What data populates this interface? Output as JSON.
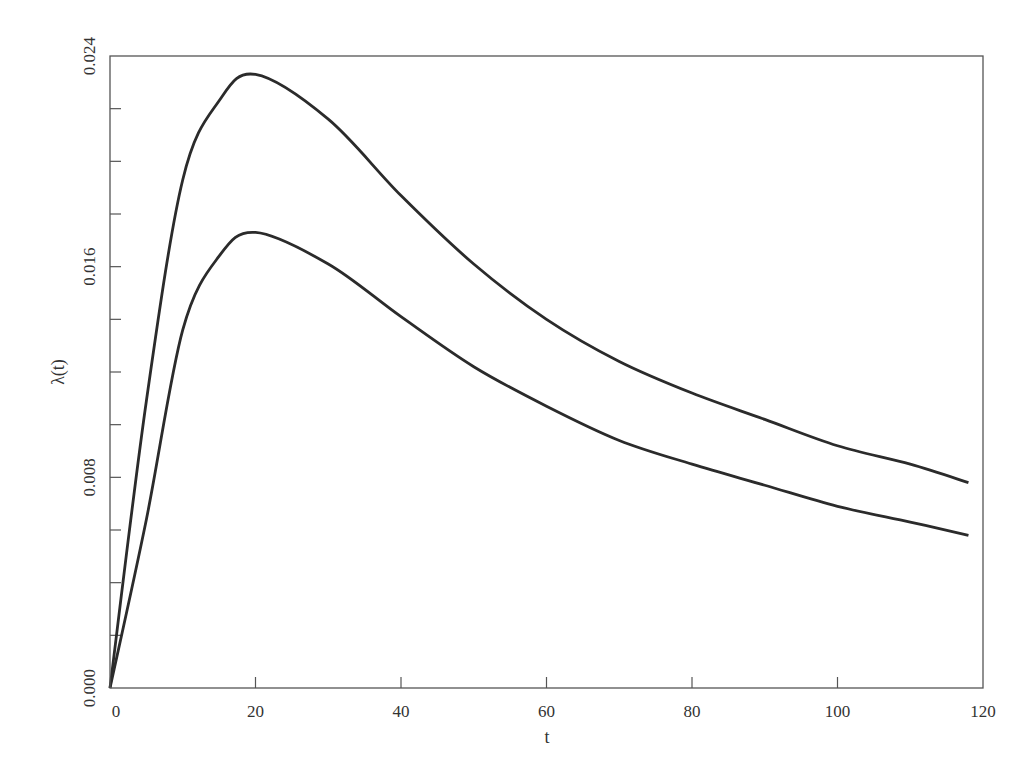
{
  "chart_data": {
    "type": "line",
    "title": "",
    "xlabel": "t",
    "ylabel": "λ(t)",
    "xlim": [
      0,
      120
    ],
    "ylim": [
      0.0,
      0.024
    ],
    "grid": false,
    "legend": null,
    "x_ticks": [
      "0",
      "20",
      "40",
      "60",
      "80",
      "100",
      "120"
    ],
    "x_tick_values": [
      0,
      20,
      40,
      60,
      80,
      100,
      120
    ],
    "y_ticks": [
      "0.000",
      "0.008",
      "0.016",
      "0.024"
    ],
    "y_tick_values": [
      0.0,
      0.008,
      0.016,
      0.024
    ],
    "y_minor_tick_values": [
      0.002,
      0.004,
      0.006,
      0.01,
      0.012,
      0.014,
      0.018,
      0.02,
      0.022
    ],
    "x": [
      0,
      5,
      10,
      15,
      20,
      30,
      40,
      50,
      60,
      70,
      80,
      90,
      100,
      110,
      118
    ],
    "series": [
      {
        "name": "upper curve",
        "color": "#2b2b2b",
        "values": [
          0.0,
          0.0109,
          0.0193,
          0.0223,
          0.0233,
          0.0216,
          0.0187,
          0.0161,
          0.014,
          0.0124,
          0.0112,
          0.0102,
          0.0092,
          0.0085,
          0.0078
        ]
      },
      {
        "name": "lower curve",
        "color": "#2b2b2b",
        "values": [
          0.0,
          0.0064,
          0.0136,
          0.0164,
          0.0173,
          0.0161,
          0.0141,
          0.0122,
          0.0107,
          0.0094,
          0.0085,
          0.0077,
          0.0069,
          0.0063,
          0.0058
        ]
      }
    ]
  }
}
